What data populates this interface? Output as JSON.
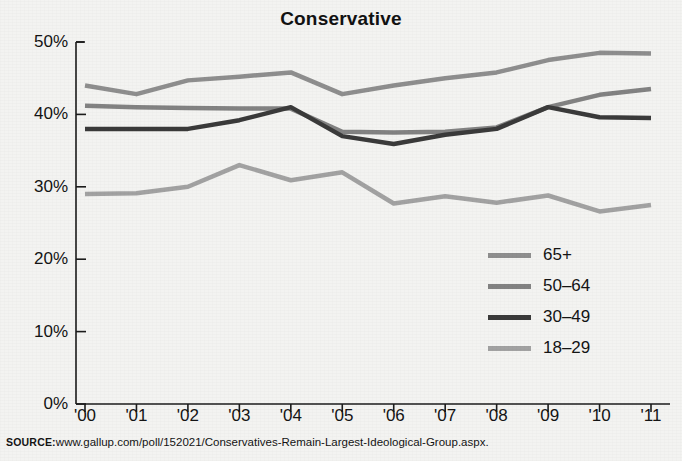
{
  "top_fragment": "‘",
  "source": {
    "key": "SOURCE:",
    "url": "www.gallup.com/poll/152021/Conservatives-Remain-Largest-Ideological-Group.aspx."
  },
  "legend": {
    "items": [
      {
        "label": "65+",
        "color": "#8e8e8e"
      },
      {
        "label": "50–64",
        "color": "#828282"
      },
      {
        "label": "30–49",
        "color": "#3a3a3a"
      },
      {
        "label": "18–29",
        "color": "#a2a2a2"
      }
    ]
  },
  "chart_data": {
    "type": "line",
    "title": "Conservative",
    "xlabel": "",
    "ylabel": "",
    "ylim": [
      0,
      50
    ],
    "yticks": [
      0,
      10,
      20,
      30,
      40,
      50
    ],
    "ytick_labels": [
      "0%",
      "10%",
      "20%",
      "30%",
      "40%",
      "50%"
    ],
    "grid": false,
    "legend_position": "inside-right",
    "categories": [
      "'00",
      "'01",
      "'02",
      "'03",
      "'04",
      "'05",
      "'06",
      "'07",
      "'08",
      "'09",
      "'10",
      "'11"
    ],
    "series": [
      {
        "name": "65+",
        "color": "#8e8e8e",
        "width": 4.5,
        "values": [
          44.0,
          42.8,
          44.7,
          45.2,
          45.8,
          42.8,
          44.0,
          45.0,
          45.8,
          47.5,
          48.5,
          48.4
        ]
      },
      {
        "name": "50–64",
        "color": "#828282",
        "width": 4.5,
        "values": [
          41.2,
          41.0,
          40.9,
          40.8,
          40.8,
          37.6,
          37.5,
          37.6,
          38.2,
          41.0,
          42.7,
          43.5
        ]
      },
      {
        "name": "30–49",
        "color": "#3a3a3a",
        "width": 4.5,
        "values": [
          38.0,
          38.0,
          38.0,
          39.2,
          41.0,
          37.0,
          35.9,
          37.2,
          38.0,
          41.0,
          39.6,
          39.5
        ]
      },
      {
        "name": "18–29",
        "color": "#a2a2a2",
        "width": 4.5,
        "values": [
          29.0,
          29.1,
          30.0,
          33.0,
          30.9,
          32.0,
          27.7,
          28.7,
          27.8,
          28.8,
          26.6,
          27.5
        ]
      }
    ]
  }
}
